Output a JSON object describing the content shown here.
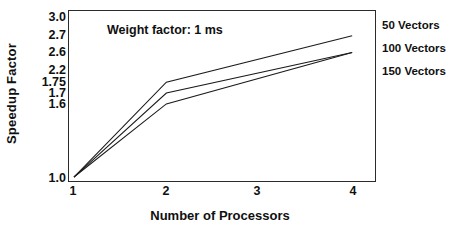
{
  "chart_data": {
    "type": "line",
    "title": "",
    "annotation": "Weight factor: 1 ms",
    "xlabel": "Number of Processors",
    "ylabel": "Speedup Factor",
    "x": [
      1,
      2,
      4
    ],
    "xticks": [
      "1",
      "2",
      "3",
      "4"
    ],
    "xtick_values": [
      1,
      2,
      3,
      4
    ],
    "xlim": [
      1,
      4
    ],
    "yticks": [
      "3.0",
      "2.7",
      "2.6",
      "2.2",
      "1.75",
      "1.7",
      "1.6",
      "1.0"
    ],
    "ytick_values": [
      3.0,
      2.7,
      2.6,
      2.2,
      1.75,
      1.7,
      1.6,
      1.0
    ],
    "ylim": [
      1.0,
      3.0
    ],
    "grid": false,
    "legend_position": "right",
    "series": [
      {
        "name": "50 Vectors",
        "values": [
          1.0,
          1.75,
          2.7
        ]
      },
      {
        "name": "100 Vectors",
        "values": [
          1.0,
          1.7,
          2.6
        ]
      },
      {
        "name": "150 Vectors",
        "values": [
          1.0,
          1.6,
          2.6
        ]
      }
    ],
    "line_color": "#1a1a1a",
    "frame_color": "#2b2b2b",
    "background": "#ffffff"
  },
  "axes": {
    "y_title": "Speedup Factor",
    "x_title": "Number of Processors"
  },
  "legend": {
    "entries": [
      {
        "label": "50 Vectors"
      },
      {
        "label": "100 Vectors"
      },
      {
        "label": "150 Vectors"
      }
    ]
  }
}
